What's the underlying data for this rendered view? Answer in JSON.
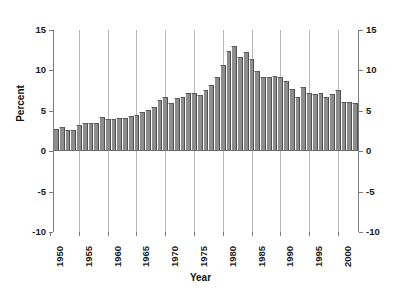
{
  "chart_data": {
    "type": "bar",
    "title": "",
    "xlabel": "Year",
    "ylabel": "Percent",
    "ylim": [
      -10,
      15
    ],
    "yticks": [
      15,
      10,
      5,
      0,
      -5,
      -10
    ],
    "ytick_labels_left": [
      "15",
      "10",
      "5",
      "0",
      "-5",
      "-10"
    ],
    "ytick_labels_right": [
      "15",
      "10",
      "5",
      "0",
      "-5",
      "-10"
    ],
    "xticks": [
      1950,
      1955,
      1960,
      1965,
      1970,
      1975,
      1980,
      1985,
      1990,
      1995,
      2000
    ],
    "xtick_labels": [
      "1950",
      "1955",
      "1960",
      "1965",
      "1970",
      "1975",
      "1980",
      "1985",
      "1990",
      "1995",
      "2000"
    ],
    "grid": "vertical-only",
    "legend": "none",
    "bar_color": "#8d8d8d",
    "categories": [
      1951,
      1952,
      1953,
      1954,
      1955,
      1956,
      1957,
      1958,
      1959,
      1960,
      1961,
      1962,
      1963,
      1964,
      1965,
      1966,
      1967,
      1968,
      1969,
      1970,
      1971,
      1972,
      1973,
      1974,
      1975,
      1976,
      1977,
      1978,
      1979,
      1980,
      1981,
      1982,
      1983,
      1984,
      1985,
      1986,
      1987,
      1988,
      1989,
      1990,
      1991,
      1992,
      1993,
      1994,
      1995,
      1996,
      1997,
      1998,
      1999,
      2000,
      2001,
      2002,
      2003
    ],
    "values": [
      2.6,
      2.9,
      2.5,
      2.5,
      3.1,
      3.3,
      3.4,
      3.4,
      4.1,
      3.9,
      3.9,
      4.0,
      4.0,
      4.2,
      4.3,
      4.7,
      4.9,
      5.3,
      6.2,
      6.6,
      5.8,
      6.4,
      6.5,
      7.0,
      7.0,
      6.8,
      7.4,
      8.0,
      9.0,
      10.5,
      12.3,
      12.9,
      11.5,
      12.1,
      11.3,
      9.8,
      9.0,
      9.0,
      9.2,
      9.0,
      8.6,
      7.5,
      6.6,
      7.8,
      7.1,
      6.9,
      7.1,
      6.5,
      6.9,
      7.4,
      6.0,
      5.9,
      5.8
    ]
  },
  "axis": {
    "y_title": "Percent",
    "x_title": "Year"
  }
}
